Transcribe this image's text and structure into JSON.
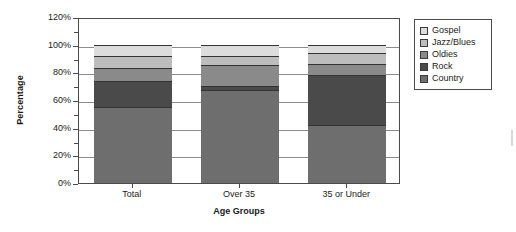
{
  "chart_data": {
    "type": "bar",
    "subtype": "stacked-vertical",
    "title": "",
    "xlabel": "Age Groups",
    "ylabel": "Percentage",
    "categories": [
      "Total",
      "Over 35",
      "35 or Under"
    ],
    "ylim": [
      0,
      120
    ],
    "ytick_values": [
      0,
      20,
      40,
      60,
      80,
      100,
      120
    ],
    "ytick_labels": [
      "0%",
      "20%",
      "40%",
      "60%",
      "80%",
      "100%",
      "120%"
    ],
    "ytick_minor_values": [
      10,
      30,
      50,
      70,
      90,
      110
    ],
    "grid": true,
    "grid_axis": "y",
    "legend_position": "right-outside",
    "stack_order_bottom_to_top": [
      "Country",
      "Rock",
      "Oldies",
      "Jazz/Blues",
      "Gospel"
    ],
    "series": [
      {
        "name": "Country",
        "color": "#6e6e6e",
        "values": [
          55,
          67,
          42
        ]
      },
      {
        "name": "Rock",
        "color": "#4a4a4a",
        "values": [
          19,
          3,
          36
        ]
      },
      {
        "name": "Oldies",
        "color": "#8a8a8a",
        "values": [
          9,
          15,
          8
        ]
      },
      {
        "name": "Jazz/Blues",
        "color": "#bdbdbd",
        "values": [
          9,
          7,
          8
        ]
      },
      {
        "name": "Gospel",
        "color": "#dcdcdc",
        "values": [
          8,
          8,
          6
        ]
      }
    ],
    "cumulative_tops": {
      "Total": {
        "Country": 55,
        "Rock": 74,
        "Oldies": 83,
        "Jazz/Blues": 92,
        "Gospel": 100
      },
      "Over 35": {
        "Country": 67,
        "Rock": 70,
        "Oldies": 85,
        "Jazz/Blues": 92,
        "Gospel": 100
      },
      "35 or Under": {
        "Country": 42,
        "Rock": 78,
        "Oldies": 86,
        "Jazz/Blues": 94,
        "Gospel": 100
      }
    }
  },
  "legend": {
    "items": [
      {
        "label": "Gospel",
        "color": "#dcdcdc"
      },
      {
        "label": "Jazz/Blues",
        "color": "#bdbdbd"
      },
      {
        "label": "Oldies",
        "color": "#8a8a8a"
      },
      {
        "label": "Rock",
        "color": "#4a4a4a"
      },
      {
        "label": "Country",
        "color": "#6e6e6e"
      }
    ]
  },
  "axes": {
    "y_title": "Percentage",
    "x_title": "Age Groups"
  }
}
